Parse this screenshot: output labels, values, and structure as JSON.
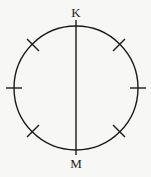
{
  "diagram": {
    "type": "circle-with-diameter",
    "labels": {
      "top": "K",
      "bottom": "M"
    },
    "circle": {
      "cx": 76,
      "cy": 88,
      "r": 62
    },
    "diameter": {
      "orientation": "vertical",
      "from": "K",
      "to": "M"
    },
    "tick_marks": {
      "count": 6,
      "angles_deg": [
        45,
        135,
        180,
        225,
        315,
        0
      ]
    },
    "colors": {
      "stroke": "#1a1a1a",
      "background": "#f7f7f5"
    }
  }
}
